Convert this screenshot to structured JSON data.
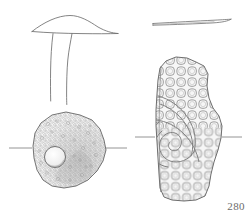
{
  "plate": {
    "kind": "archaeological-finds-illustration",
    "background_color": "#ffffff",
    "ink_color": "#6e6e6e",
    "texture_color": "#8a8a8a",
    "catalogue_number": "280",
    "section_axis_color": "#7a7a7a",
    "objects": [
      {
        "id": "object-left",
        "label": "mushroom-headed-stud",
        "views": [
          {
            "id": "left-profile-view",
            "type": "profile-section",
            "description": "T-shaped / mushroom profile: wide low-domed flange head with a long tapering shank below",
            "head_width": 96,
            "shank_width": 14
          },
          {
            "id": "left-plan-view",
            "type": "plan",
            "description": "Irregular rounded disc head with dense stippled granular texture and one circular perforation at lower left",
            "diameter": 78,
            "perforation_diameter": 20,
            "has_section_axis": true
          }
        ]
      },
      {
        "id": "object-right",
        "label": "cellular-patterned-plaque-fragment",
        "views": [
          {
            "id": "right-profile-view",
            "type": "profile-section",
            "description": "Thin slightly curved sliver, edge-on section of a flat plaque",
            "length": 92,
            "thickness": 3
          },
          {
            "id": "right-plan-view",
            "type": "plan",
            "description": "Tall stepped fragment covered in honeycomb cellular scales with a curved volute / scroll motif across the lower left",
            "height": 150,
            "width": 74,
            "has_section_axis": true
          }
        ]
      }
    ],
    "annotations": [
      {
        "id": "catalogue-label",
        "text": "280"
      }
    ]
  }
}
